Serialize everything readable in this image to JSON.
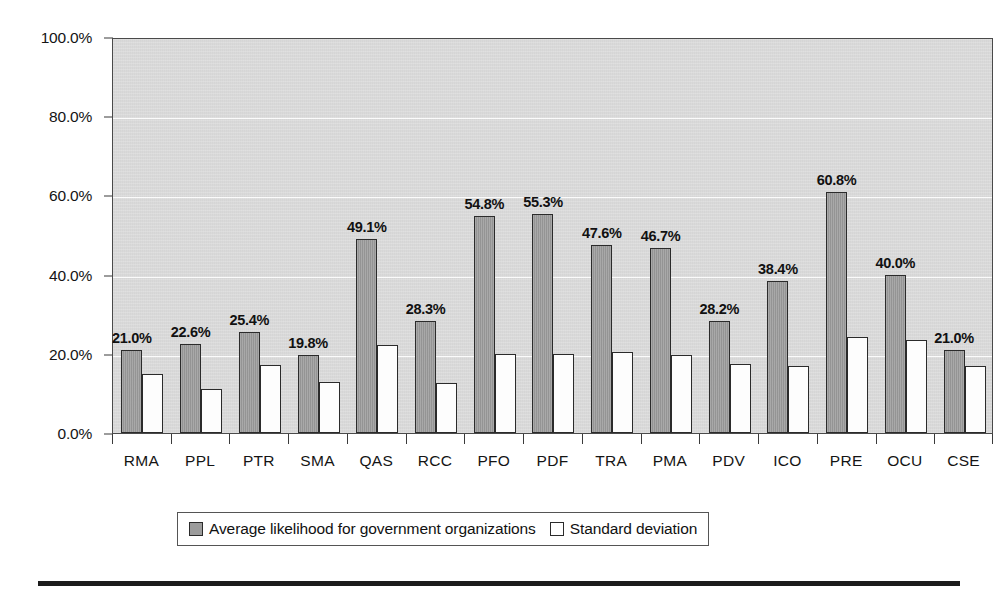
{
  "chart_data": {
    "type": "bar",
    "title": "",
    "xlabel": "",
    "ylabel": "",
    "ylim": [
      0,
      100
    ],
    "ytick_labels": [
      "0.0%",
      "20.0%",
      "40.0%",
      "60.0%",
      "80.0%",
      "100.0%"
    ],
    "ytick_values": [
      0,
      20,
      40,
      60,
      80,
      100
    ],
    "grid": true,
    "legend_position": "bottom",
    "categories": [
      "RMA",
      "PPL",
      "PTR",
      "SMA",
      "QAS",
      "RCC",
      "PFO",
      "PDF",
      "TRA",
      "PMA",
      "PDV",
      "ICO",
      "PRE",
      "OCU",
      "CSE"
    ],
    "series": [
      {
        "name": "Average likelihood for government organizations",
        "color": "#9c9c9c",
        "values": [
          21.0,
          22.6,
          25.4,
          19.8,
          49.1,
          28.3,
          54.8,
          55.3,
          47.6,
          46.7,
          28.2,
          38.4,
          60.8,
          40.0,
          21.0
        ],
        "labels": [
          "21.0%",
          "22.6%",
          "25.4%",
          "19.8%",
          "49.1%",
          "28.3%",
          "54.8%",
          "55.3%",
          "47.6%",
          "46.7%",
          "28.2%",
          "38.4%",
          "60.8%",
          "40.0%",
          "21.0%"
        ]
      },
      {
        "name": "Standard deviation",
        "color": "#ffffff",
        "values": [
          14.8,
          11.0,
          17.3,
          13.0,
          22.3,
          12.7,
          20.0,
          20.0,
          20.5,
          19.8,
          17.4,
          17.0,
          24.3,
          23.5,
          17.0
        ],
        "labels": [
          "",
          "",
          "",
          "",
          "",
          "",
          "",
          "",
          "",
          "",
          "",
          "",
          "",
          "",
          ""
        ]
      }
    ]
  },
  "legend": {
    "entries": [
      {
        "label": "Average likelihood for government organizations",
        "swatch": "avg"
      },
      {
        "label": "Standard deviation",
        "swatch": "sd"
      }
    ]
  }
}
